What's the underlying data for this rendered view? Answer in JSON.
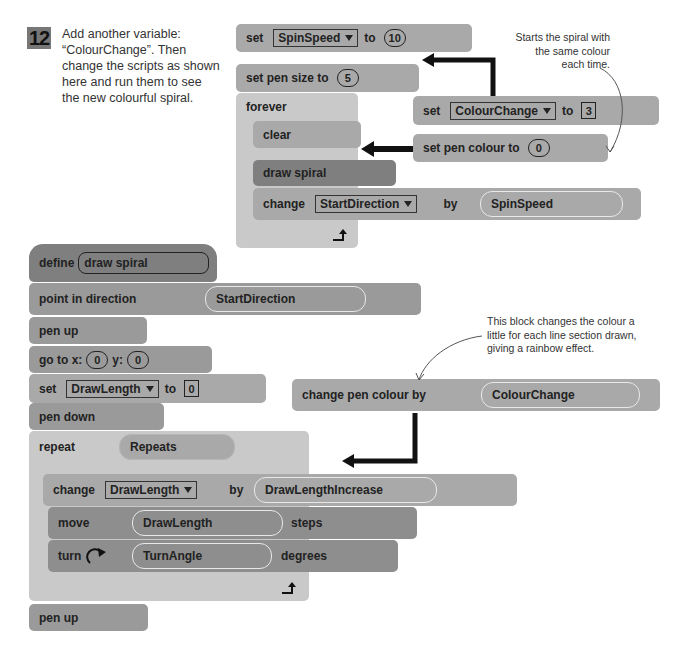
{
  "step": {
    "number": "12",
    "instruction": "Add another variable: “ColourChange”. Then change the scripts as shown here and run them to see the new colourful spiral."
  },
  "annotations": {
    "spiral_start": "Starts the spiral with the same colour each time.",
    "rainbow": "This block changes the colour a little for each line section drawn, giving a rainbow effect."
  },
  "main_script": {
    "set_spin": {
      "label": "set",
      "variable": "SpinSpeed",
      "to": "to",
      "value": "10"
    },
    "pen_size": {
      "label": "set pen size to",
      "value": "5"
    },
    "forever": {
      "label": "forever"
    },
    "clear": {
      "label": "clear"
    },
    "draw_spiral": {
      "label": "draw spiral"
    },
    "change_dir": {
      "label": "change",
      "variable": "StartDirection",
      "by": "by",
      "value": "SpinSpeed"
    }
  },
  "new_blocks_main": {
    "set_colour_change": {
      "label": "set",
      "variable": "ColourChange",
      "to": "to",
      "value": "3"
    },
    "set_pen_colour": {
      "label": "set pen colour to",
      "value": "0"
    }
  },
  "define_script": {
    "define": {
      "label": "define",
      "name": "draw spiral"
    },
    "point": {
      "label": "point in direction",
      "value": "StartDirection"
    },
    "pen_up1": {
      "label": "pen up"
    },
    "goto": {
      "label": "go to x:",
      "x": "0",
      "ylabel": "y:",
      "y": "0"
    },
    "set_len": {
      "label": "set",
      "variable": "DrawLength",
      "to": "to",
      "value": "0"
    },
    "pen_down": {
      "label": "pen down"
    },
    "repeat": {
      "label": "repeat",
      "value": "Repeats"
    },
    "change_len": {
      "label": "change",
      "variable": "DrawLength",
      "by": "by",
      "value": "DrawLengthIncrease"
    },
    "move": {
      "label": "move",
      "value": "DrawLength",
      "suffix": "steps"
    },
    "turn": {
      "label": "turn",
      "value": "TurnAngle",
      "suffix": "degrees"
    },
    "pen_up2": {
      "label": "pen up"
    }
  },
  "new_blocks_define": {
    "change_pen_colour": {
      "label": "change pen colour by",
      "value": "ColourChange"
    }
  }
}
